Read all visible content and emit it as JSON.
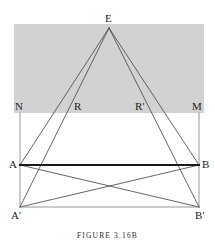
{
  "figure": {
    "caption": "FIGURE 3.16B",
    "colors": {
      "background": "#ffffff",
      "shaded_region": "#d2d2d2",
      "thin_line": "#6f6f6f",
      "ray_line": "#4a4a4a",
      "bold_line": "#1a1a1a",
      "label_text": "#1d1d1d",
      "caption_text": "#2a2a2a"
    },
    "shaded_region": {
      "name": "gray-band",
      "x": 14,
      "y": 24,
      "width": 190,
      "height": 89
    },
    "points": [
      {
        "id": "E",
        "label": "E",
        "x": 109,
        "y": 28,
        "label_x": 105,
        "label_y": 13
      },
      {
        "id": "N",
        "label": "N",
        "x": 20,
        "y": 113,
        "label_x": 15,
        "label_y": 101
      },
      {
        "id": "R",
        "label": "R",
        "x": 79,
        "y": 113,
        "label_x": 74,
        "label_y": 101
      },
      {
        "id": "Rp",
        "label": "R'",
        "x": 141,
        "y": 113,
        "label_x": 135,
        "label_y": 101
      },
      {
        "id": "M",
        "label": "M",
        "x": 199,
        "y": 113,
        "label_x": 192,
        "label_y": 101
      },
      {
        "id": "A",
        "label": "A",
        "x": 20,
        "y": 165,
        "label_x": 9,
        "label_y": 159
      },
      {
        "id": "B",
        "label": "B",
        "x": 199,
        "y": 165,
        "label_x": 202,
        "label_y": 159
      },
      {
        "id": "Ap",
        "label": "A'",
        "x": 20,
        "y": 207,
        "label_x": 11,
        "label_y": 210
      },
      {
        "id": "Bp",
        "label": "B'",
        "x": 199,
        "y": 207,
        "label_x": 195,
        "label_y": 210
      }
    ],
    "segments": [
      {
        "name": "segment-E-A",
        "from": "E",
        "to": "A",
        "style": "ray"
      },
      {
        "name": "segment-E-B",
        "from": "E",
        "to": "B",
        "style": "ray"
      },
      {
        "name": "segment-E-A-prime",
        "from": "E",
        "to": "Ap",
        "style": "ray"
      },
      {
        "name": "segment-E-B-prime",
        "from": "E",
        "to": "Bp",
        "style": "ray"
      },
      {
        "name": "segment-N-A-prime",
        "from": "N",
        "to": "Ap",
        "style": "thin"
      },
      {
        "name": "segment-M-B-prime",
        "from": "M",
        "to": "Bp",
        "style": "thin"
      },
      {
        "name": "segment-A-B-prime",
        "from": "A",
        "to": "Bp",
        "style": "ray"
      },
      {
        "name": "segment-A-prime-B",
        "from": "Ap",
        "to": "B",
        "style": "ray"
      },
      {
        "name": "segment-A-prime-B-prime",
        "from": "Ap",
        "to": "Bp",
        "style": "thin"
      },
      {
        "name": "segment-A-B",
        "from": "A",
        "to": "B",
        "style": "bold"
      }
    ]
  }
}
